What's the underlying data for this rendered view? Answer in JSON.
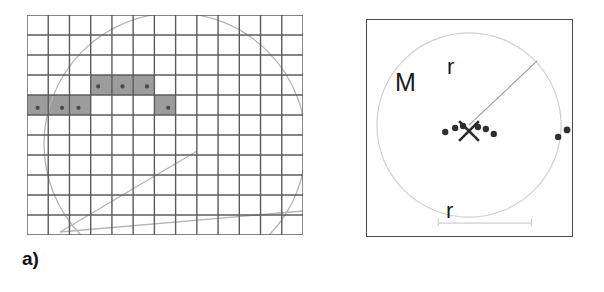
{
  "figure": {
    "width": 604,
    "height": 292,
    "background": "#ffffff"
  },
  "panels": [
    {
      "id": "a",
      "label": "a)",
      "description": "raster grid with highlighted cells, circle arc and two radial lines",
      "grid": {
        "columns": 13,
        "rows": 11,
        "cell_width": 21.2,
        "cell_height": 20.0,
        "line_color": "#5b5b5b",
        "line_width": 1.4,
        "fill_color": "#fdfdfd"
      },
      "highlighted_cells": [
        {
          "col": 3,
          "row": 3,
          "dot": true
        },
        {
          "col": 4,
          "row": 3,
          "dot": true
        },
        {
          "col": 5,
          "row": 3,
          "dot": true
        },
        {
          "col": 0,
          "row": 4,
          "dot": true
        },
        {
          "col": 1,
          "row": 4,
          "dot": true
        },
        {
          "col": 2,
          "row": 4,
          "dot": true
        },
        {
          "col": 6,
          "row": 4,
          "dot": true
        }
      ],
      "cell_fill_color": "#9c9c9c",
      "cell_dot_color": "#4a4a4a",
      "overlay": {
        "circle": {
          "cx": 148,
          "cy": 129,
          "r": 131,
          "stroke": "#b4b4b4"
        },
        "lines": [
          {
            "x1": 33,
            "y1": 217,
            "x2": 170,
            "y2": 136,
            "stroke": "#b4b4b4"
          },
          {
            "x1": 33,
            "y1": 217,
            "x2": 276,
            "y2": 196,
            "stroke": "#b4b4b4"
          }
        ]
      }
    },
    {
      "id": "b",
      "label": "b)",
      "description": "square frame with circle of radius r, centre marker M, and two dot clusters",
      "frame": {
        "stroke": "#4a4a4a",
        "fill": "#ffffff"
      },
      "circle": {
        "cx": 103,
        "cy": 106,
        "r": 93,
        "stroke": "#cfcfcf"
      },
      "radius_line": {
        "x1": 103,
        "y1": 106,
        "x2": 172,
        "y2": 41,
        "stroke": "#9a9a9a"
      },
      "center_marker": {
        "x": 103,
        "y": 112,
        "type": "cross-x",
        "color": "#2a2a2a"
      },
      "labels": {
        "center": "M",
        "radius_top": "r",
        "radius_bottom": "r"
      },
      "scale_bar": {
        "x1": 72,
        "y1": 205,
        "x2": 166,
        "y2": 205,
        "stroke": "#d0d0d0"
      },
      "dot_clusters": [
        {
          "name": "centre-cluster",
          "color": "#2f2f2f",
          "dots": [
            {
              "x": 79,
              "y": 113,
              "r": 3.2
            },
            {
              "x": 89,
              "y": 109,
              "r": 3.2
            },
            {
              "x": 97,
              "y": 107,
              "r": 3.2
            },
            {
              "x": 112,
              "y": 108,
              "r": 3.2
            },
            {
              "x": 120,
              "y": 110,
              "r": 3.2
            },
            {
              "x": 128,
              "y": 115,
              "r": 3.2
            }
          ]
        },
        {
          "name": "right-arc-cluster",
          "color": "#2f2f2f",
          "dots": [
            {
              "x": 193,
              "y": 118,
              "r": 3.2
            },
            {
              "x": 202,
              "y": 111,
              "r": 3.4
            },
            {
              "x": 212,
              "y": 108,
              "r": 3.4
            },
            {
              "x": 222,
              "y": 108,
              "r": 3.4
            },
            {
              "x": 231,
              "y": 112,
              "r": 3.4
            },
            {
              "x": 239,
              "y": 118,
              "r": 3.2
            }
          ]
        }
      ]
    }
  ]
}
